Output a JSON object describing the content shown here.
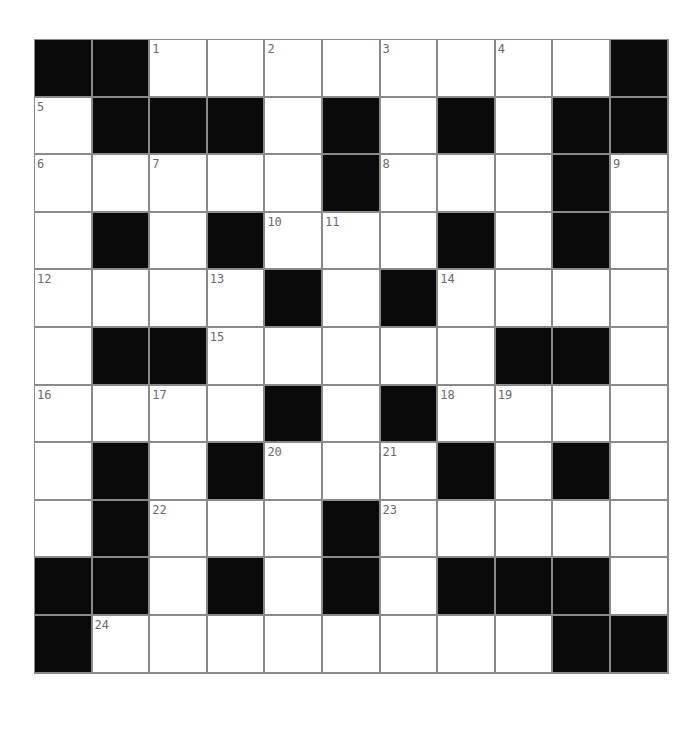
{
  "puzzle": {
    "rows": 11,
    "cols": 11,
    "colors": {
      "block": "#0a0a0a",
      "cell": "#ffffff",
      "gridline": "#8a8a8a",
      "number": "#6a6a6a"
    },
    "grid": [
      [
        "#",
        "#",
        "1",
        "",
        "2",
        "",
        "3",
        "",
        "4",
        "",
        "#"
      ],
      [
        "5",
        "#",
        "#",
        "#",
        "",
        "#",
        "",
        "#",
        "",
        "#",
        "#"
      ],
      [
        "6",
        "",
        "7",
        "",
        "",
        "#",
        "8",
        "",
        "",
        "#",
        "9"
      ],
      [
        "",
        "#",
        "",
        "#",
        "10",
        "11",
        "",
        "#",
        "",
        "#",
        ""
      ],
      [
        "12",
        "",
        "",
        "13",
        "#",
        "",
        "#",
        "14",
        "",
        "",
        ""
      ],
      [
        "",
        "#",
        "#",
        "15",
        "",
        "",
        "",
        "",
        "#",
        "#",
        ""
      ],
      [
        "16",
        "",
        "17",
        "",
        "#",
        "",
        "#",
        "18",
        "19",
        "",
        ""
      ],
      [
        "",
        "#",
        "",
        "#",
        "20",
        "",
        "21",
        "#",
        "",
        "#",
        ""
      ],
      [
        "",
        "#",
        "22",
        "",
        "",
        "#",
        "23",
        "",
        "",
        "",
        ""
      ],
      [
        "#",
        "#",
        "",
        "#",
        "",
        "#",
        "",
        "#",
        "#",
        "#",
        ""
      ],
      [
        "#",
        "24",
        "",
        "",
        "",
        "",
        "",
        "",
        "",
        "#",
        "#"
      ]
    ]
  }
}
